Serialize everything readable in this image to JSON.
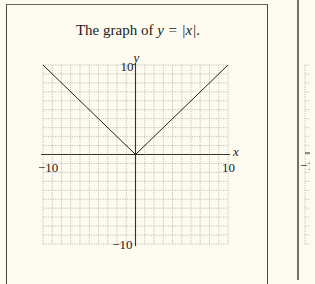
{
  "figure": {
    "title_prefix": "The graph of ",
    "title_expr": "y = |x|",
    "title_suffix": ".",
    "xaxis_label": "x",
    "yaxis_label": "y",
    "tick_labels": {
      "x_min": "−10",
      "x_max": "10",
      "y_min": "−10",
      "y_max": "10"
    },
    "line_color": "#222222",
    "grid_color": "#9a9a9a",
    "background": "#fdfbf0"
  },
  "chart_data": {
    "type": "line",
    "title": "The graph of y = |x|.",
    "xlabel": "x",
    "ylabel": "y",
    "xlim": [
      -10,
      10
    ],
    "ylim": [
      -10,
      10
    ],
    "grid": true,
    "grid_step": 1,
    "series": [
      {
        "name": "y = |x|",
        "x": [
          -10,
          0,
          10
        ],
        "y": [
          10,
          0,
          10
        ]
      }
    ]
  }
}
